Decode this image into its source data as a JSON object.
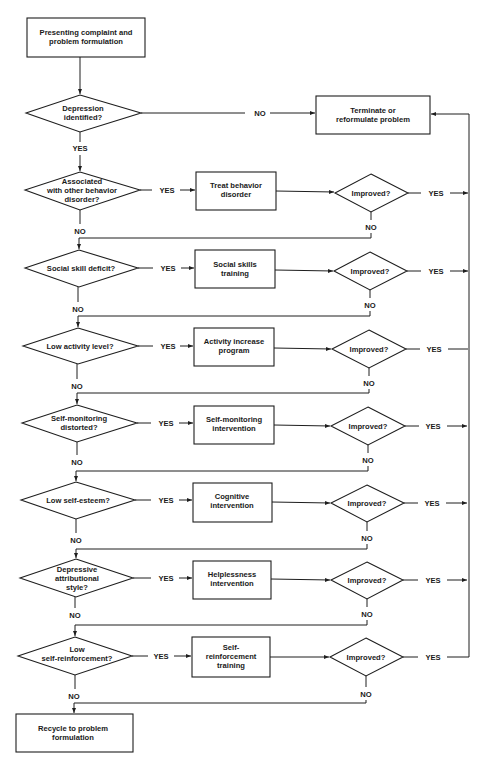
{
  "diagram": {
    "start": {
      "lines": [
        "Presenting complaint and",
        "problem formulation"
      ]
    },
    "depression": {
      "lines": [
        "Depression",
        "identified?"
      ],
      "yes": "YES",
      "no": "NO"
    },
    "terminate": {
      "lines": [
        "Terminate or",
        "reformulate problem"
      ]
    },
    "rows": [
      {
        "decision": [
          "Associated",
          "with other behavior",
          "disorder?"
        ],
        "treatment": [
          "Treat behavior",
          "disorder"
        ],
        "check": "Improved?",
        "yes": "YES",
        "no": "NO",
        "check_no": "NO"
      },
      {
        "decision": [
          "Social skill deficit?"
        ],
        "treatment": [
          "Social skills",
          "training"
        ],
        "check": "Improved?",
        "yes": "YES",
        "no": "NO",
        "check_no": "NO"
      },
      {
        "decision": [
          "Low activity level?"
        ],
        "treatment": [
          "Activity increase",
          "program"
        ],
        "check": "Improved?",
        "yes": "YES",
        "no": "NO",
        "check_no": "NO"
      },
      {
        "decision": [
          "Self-monitoring",
          "distorted?"
        ],
        "treatment": [
          "Self-monitoring",
          "intervention"
        ],
        "check": "Improved?",
        "yes": "YES",
        "no": "NO",
        "check_no": "NO"
      },
      {
        "decision": [
          "Low self-esteem?"
        ],
        "treatment": [
          "Cognitive",
          "intervention"
        ],
        "check": "Improved?",
        "yes": "YES",
        "no": "NO",
        "check_no": "NO"
      },
      {
        "decision": [
          "Depressive",
          "attributional",
          "style?"
        ],
        "treatment": [
          "Helplessness",
          "intervention"
        ],
        "check": "Improved?",
        "yes": "YES",
        "no": "NO",
        "check_no": "NO"
      },
      {
        "decision": [
          "Low",
          "self-reinforcement?"
        ],
        "treatment": [
          "Self-",
          "reinforcement",
          "training"
        ],
        "check": "Improved?",
        "yes": "YES",
        "no": "NO",
        "check_no": "NO"
      }
    ],
    "end": {
      "lines": [
        "Recycle to problem",
        "formulation"
      ]
    }
  }
}
